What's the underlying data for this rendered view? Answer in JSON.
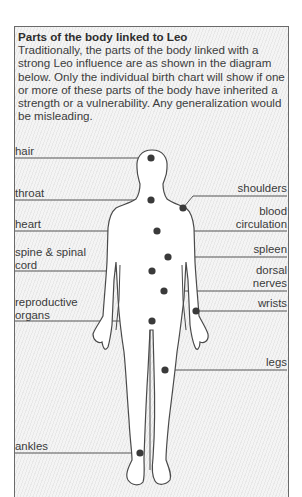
{
  "title": "Parts of the body linked to Leo",
  "intro_text": "Traditionally, the parts of the body linked with a strong Leo influence are as shown in the diagram below. Only the individual birth chart will show if one or more of these parts of the body have inherited a strength or a vulnerability. Any generalization would be misleading.",
  "labels": {
    "hair": "hair",
    "throat": "throat",
    "heart": "heart",
    "spine_line1": "spine & spinal",
    "spine_line2": "cord",
    "reproductive_line1": "reproductive",
    "reproductive_line2": "organs",
    "ankles": "ankles",
    "shoulders": "shoulders",
    "blood_line1": "blood",
    "blood_line2": "circulation",
    "spleen": "spleen",
    "dorsal_line1": "dorsal",
    "dorsal_line2": "nerves",
    "wrists": "wrists",
    "legs": "legs"
  },
  "colors": {
    "line": "#555555",
    "dot": "#3a3a3a",
    "body_fill": "#ffffff",
    "body_outline": "#4a4a4a"
  }
}
